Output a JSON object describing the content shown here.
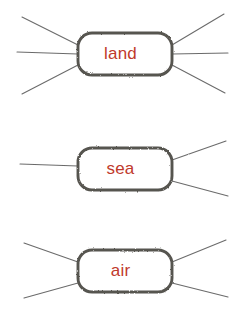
{
  "diagram": {
    "background_color": "#ffffff",
    "label_color": "#c0392b",
    "node_border_color": "#575450",
    "connector_color": "#6b6b6b",
    "nodes": [
      {
        "id": "land",
        "label": "land",
        "shape": "rounded-rectangle",
        "x": 78,
        "y": 33,
        "width": 94,
        "height": 42,
        "label_x": 125,
        "label_y": 54,
        "connector_count": 6,
        "connectors_left": [
          "up-diagonal",
          "horizontal",
          "down-diagonal"
        ],
        "connectors_right": [
          "up-diagonal",
          "horizontal",
          "down-diagonal"
        ]
      },
      {
        "id": "sea",
        "label": "sea",
        "shape": "rounded-rectangle",
        "x": 78,
        "y": 148,
        "width": 94,
        "height": 42,
        "label_x": 125,
        "label_y": 169,
        "connector_count": 3,
        "connectors_left": [
          "horizontal"
        ],
        "connectors_right": [
          "up-diagonal",
          "down-diagonal"
        ]
      },
      {
        "id": "air",
        "label": "air",
        "shape": "rounded-rectangle",
        "x": 78,
        "y": 250,
        "width": 94,
        "height": 42,
        "label_x": 125,
        "label_y": 271,
        "connector_count": 4,
        "connectors_left": [
          "up-diagonal",
          "down-diagonal"
        ],
        "connectors_right": [
          "up-diagonal",
          "down-diagonal"
        ]
      }
    ],
    "connectors": [
      {
        "id": "land-left-up",
        "node": "land",
        "side": "left",
        "x1": 78,
        "y1": 45,
        "x2": 22,
        "y2": 17
      },
      {
        "id": "land-left-mid",
        "node": "land",
        "side": "left",
        "x1": 78,
        "y1": 54,
        "x2": 17,
        "y2": 52
      },
      {
        "id": "land-left-down",
        "node": "land",
        "side": "left",
        "x1": 78,
        "y1": 65,
        "x2": 22,
        "y2": 94
      },
      {
        "id": "land-right-up",
        "node": "land",
        "side": "right",
        "x1": 172,
        "y1": 45,
        "x2": 224,
        "y2": 14
      },
      {
        "id": "land-right-mid",
        "node": "land",
        "side": "right",
        "x1": 172,
        "y1": 54,
        "x2": 228,
        "y2": 53
      },
      {
        "id": "land-right-down",
        "node": "land",
        "side": "right",
        "x1": 172,
        "y1": 65,
        "x2": 225,
        "y2": 93
      },
      {
        "id": "sea-left-mid",
        "node": "sea",
        "side": "left",
        "x1": 78,
        "y1": 166,
        "x2": 20,
        "y2": 164
      },
      {
        "id": "sea-right-up",
        "node": "sea",
        "side": "right",
        "x1": 172,
        "y1": 160,
        "x2": 226,
        "y2": 141
      },
      {
        "id": "sea-right-down",
        "node": "sea",
        "side": "right",
        "x1": 172,
        "y1": 181,
        "x2": 228,
        "y2": 196
      },
      {
        "id": "air-left-up",
        "node": "air",
        "side": "left",
        "x1": 78,
        "y1": 262,
        "x2": 24,
        "y2": 243
      },
      {
        "id": "air-left-down",
        "node": "air",
        "side": "left",
        "x1": 78,
        "y1": 283,
        "x2": 24,
        "y2": 298
      },
      {
        "id": "air-right-up",
        "node": "air",
        "side": "right",
        "x1": 172,
        "y1": 262,
        "x2": 226,
        "y2": 240
      },
      {
        "id": "air-right-down",
        "node": "air",
        "side": "right",
        "x1": 172,
        "y1": 283,
        "x2": 228,
        "y2": 297
      }
    ]
  }
}
